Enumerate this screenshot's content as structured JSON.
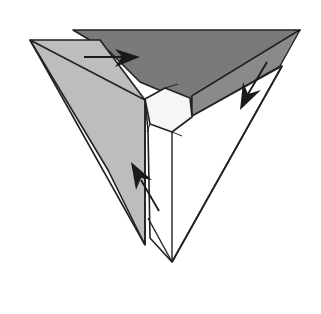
{
  "diagram": {
    "type": "origami-fold-diagram",
    "description": "Triangular pyramid folding step with three flaps and fold arrows",
    "colors": {
      "background": "#ffffff",
      "left_flap": "#bdbdbd",
      "top_flap": "#7a7a7a",
      "front_face": "#ffffff",
      "center_hexagon": "#f6f6f6",
      "stroke": "#222222",
      "arrow": "#1a1a1a"
    },
    "flaps": [
      {
        "id": "left-flap",
        "shade": "light-gray"
      },
      {
        "id": "top-flap",
        "shade": "dark-gray"
      },
      {
        "id": "front-face",
        "shade": "white"
      }
    ],
    "arrows": [
      {
        "id": "arrow-top-right",
        "direction": "right"
      },
      {
        "id": "arrow-right-down",
        "direction": "down-left"
      },
      {
        "id": "arrow-bottom-up",
        "direction": "up-left"
      }
    ]
  }
}
